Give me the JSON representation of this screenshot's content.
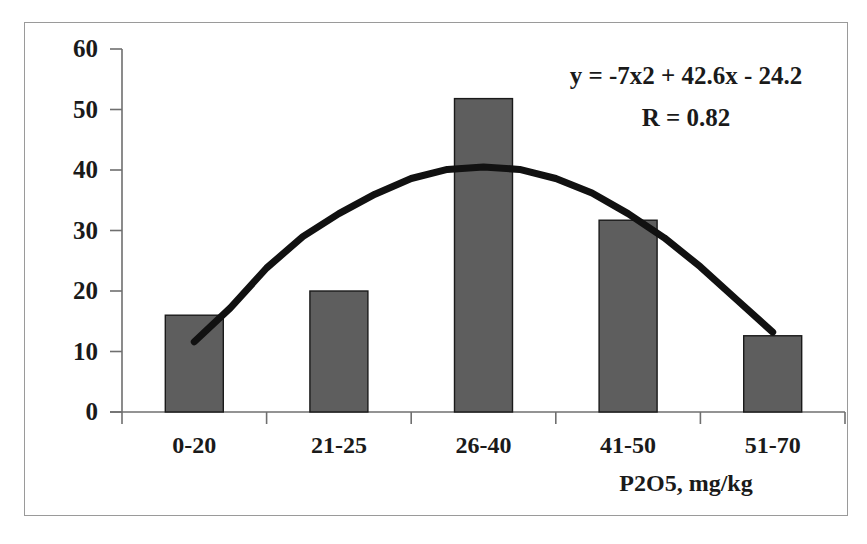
{
  "chart_data": {
    "type": "bar",
    "title": "",
    "subtitle": "",
    "xlabel": "P2O5, mg/kg",
    "ylabel": "",
    "categories": [
      "0-20",
      "21-25",
      "26-40",
      "41-50",
      "51-70"
    ],
    "values": [
      16.0,
      20.0,
      51.8,
      31.7,
      12.6
    ],
    "ylim": [
      0,
      60
    ],
    "yticks": [
      0,
      10,
      20,
      30,
      40,
      50,
      60
    ],
    "ytick_labels": [
      "0",
      "10",
      "20",
      "30",
      "40",
      "50",
      "60"
    ],
    "grid": false,
    "legend": null,
    "bar_color": "#5e5e5e",
    "bar_edge_color": "#1a1a1a",
    "series": [
      {
        "name": "P2O5 distribution",
        "values": [
          16.0,
          20.0,
          51.8,
          31.7,
          12.6
        ]
      }
    ],
    "trendline": {
      "type": "polynomial",
      "order": 2,
      "equation": "y = -7x2 + 42.6x - 24.2",
      "r_label": "R = 0.82",
      "r_value": 0.82,
      "coefficients": {
        "a": -7,
        "b": 42.6,
        "c": -24.2
      },
      "color": "#111111",
      "points_xy": [
        [
          1.0,
          11.6
        ],
        [
          1.25,
          17.2
        ],
        [
          1.5,
          23.8
        ],
        [
          1.75,
          29.0
        ],
        [
          2.0,
          32.8
        ],
        [
          2.25,
          36.0
        ],
        [
          2.5,
          38.6
        ],
        [
          2.75,
          40.1
        ],
        [
          3.0,
          40.5
        ],
        [
          3.25,
          40.1
        ],
        [
          3.5,
          38.6
        ],
        [
          3.75,
          36.2
        ],
        [
          4.0,
          32.8
        ],
        [
          4.25,
          28.8
        ],
        [
          4.5,
          24.0
        ],
        [
          4.75,
          18.6
        ],
        [
          5.0,
          13.2
        ]
      ]
    },
    "annotations": [
      {
        "name": "trendline-equation",
        "text": "y = -7x2 + 42.6x - 24.2"
      },
      {
        "name": "correlation-coefficient",
        "text": "R = 0.82"
      }
    ]
  }
}
